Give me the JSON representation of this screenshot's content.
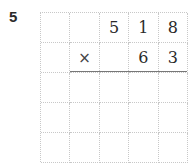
{
  "problem": {
    "number": "5",
    "type": "vertical-multiplication",
    "multiplicand": "518",
    "multiplier": "63",
    "operator": "×",
    "grid": {
      "columns": 5,
      "rows": 5,
      "cells": [
        [
          "",
          "",
          "5",
          "1",
          "8"
        ],
        [
          "",
          "×",
          "",
          "6",
          "3"
        ],
        [
          "",
          "",
          "",
          "",
          ""
        ],
        [
          "",
          "",
          "",
          "",
          ""
        ],
        [
          "",
          "",
          "",
          "",
          ""
        ]
      ]
    }
  }
}
